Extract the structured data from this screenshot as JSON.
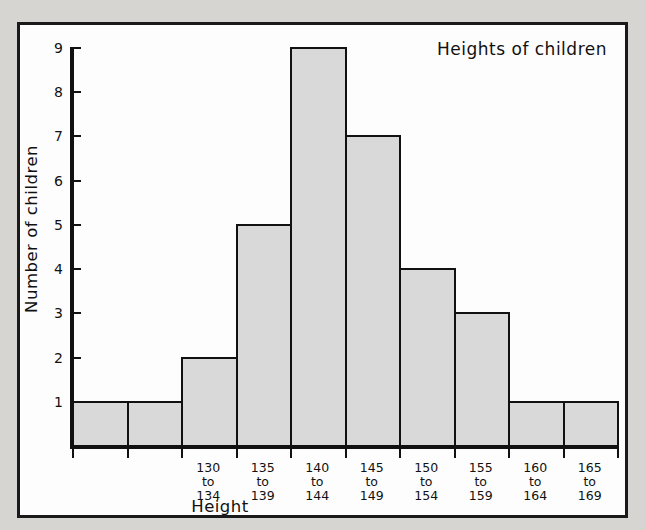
{
  "chart_data": {
    "type": "bar",
    "title": "Heights of children",
    "xlabel": "Height",
    "ylabel": "Number of children",
    "categories": [
      "",
      "",
      "130\nto\n134",
      "135\nto\n139",
      "140\nto\n144",
      "145\nto\n149",
      "150\nto\n154",
      "155\nto\n159",
      "160\nto\n164",
      "165\nto\n169"
    ],
    "values": [
      1,
      1,
      2,
      5,
      9,
      7,
      4,
      3,
      1,
      1
    ],
    "ylim": [
      0,
      9
    ],
    "yticks": [
      1,
      2,
      3,
      4,
      5,
      6,
      7,
      8,
      9
    ],
    "ytick_labels": [
      "1",
      "2",
      "3",
      "4",
      "5",
      "6",
      "7",
      "8",
      "9"
    ],
    "grid": false,
    "legend": null,
    "bar_fill_color": "#d9d9d9",
    "bar_edge_color": "#111111",
    "axis_color": "#111111",
    "plot_background": "#fdfdfd",
    "page_background": "#d6d5d2"
  }
}
